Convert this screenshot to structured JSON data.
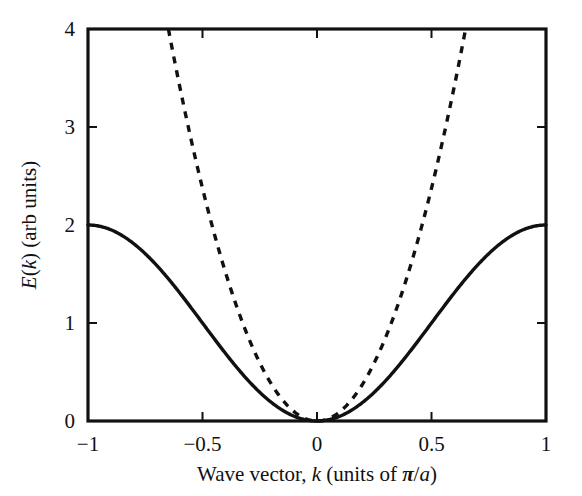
{
  "figure": {
    "background_color": "#ffffff",
    "ink_color": "#111111"
  },
  "chart_data": {
    "type": "line",
    "title": "",
    "subtitle": "",
    "xlabel": "Wave vector, k (units of π/a)",
    "ylabel": "E(k) (arb units)",
    "xlabel_parts": {
      "lead": "Wave vector, ",
      "k": "k",
      "mid": " (units of ",
      "pi": "π",
      "slash": "/",
      "a": "a",
      "close": ")"
    },
    "ylabel_parts": {
      "E": "E",
      "open": "(",
      "k": "k",
      "close": ")",
      "units": " (arb units)"
    },
    "xlim": [
      -1,
      1
    ],
    "ylim": [
      0,
      4
    ],
    "xticks": [
      -1,
      -0.5,
      0,
      0.5,
      1
    ],
    "xtick_labels": [
      "−1",
      "−0.5",
      "0",
      "0.5",
      "1"
    ],
    "yticks": [
      0,
      1,
      2,
      3,
      4
    ],
    "ytick_labels": [
      "0",
      "1",
      "2",
      "3",
      "4"
    ],
    "grid": false,
    "legend": null,
    "frame": "full-box",
    "tick_direction": "in",
    "series": [
      {
        "name": "Tight-binding band",
        "style": "solid",
        "color": "#111111",
        "equation": "E(k) = 1 - cos(pi*k)",
        "x": [
          -1,
          -0.9,
          -0.8,
          -0.7,
          -0.6,
          -0.5,
          -0.4,
          -0.3,
          -0.2,
          -0.1,
          0,
          0.1,
          0.2,
          0.3,
          0.4,
          0.5,
          0.6,
          0.7,
          0.8,
          0.9,
          1
        ],
        "values": [
          2,
          1.951,
          1.809,
          1.588,
          1.309,
          1,
          0.691,
          0.412,
          0.191,
          0.049,
          0,
          0.049,
          0.191,
          0.412,
          0.691,
          1,
          1.309,
          1.588,
          1.809,
          1.951,
          2
        ]
      },
      {
        "name": "Free-electron parabola",
        "style": "dashed",
        "color": "#111111",
        "equation": "E(k) = 9.5*k^2",
        "x": [
          -0.649,
          -0.6,
          -0.5,
          -0.4,
          -0.3,
          -0.2,
          -0.1,
          0,
          0.1,
          0.2,
          0.3,
          0.4,
          0.5,
          0.6,
          0.649
        ],
        "values": [
          4.0,
          3.42,
          2.375,
          1.52,
          0.855,
          0.38,
          0.095,
          0,
          0.095,
          0.38,
          0.855,
          1.52,
          2.375,
          3.42,
          4.0
        ]
      }
    ],
    "annotations": []
  }
}
